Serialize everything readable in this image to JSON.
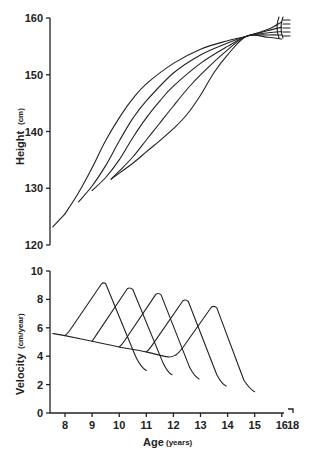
{
  "chart_data": [
    {
      "type": "line",
      "title": "",
      "ylabel": "Height",
      "ylabel_unit": "(cm)",
      "xlabel": "",
      "ylim": [
        120,
        160
      ],
      "xlim": [
        7.55,
        16.3
      ],
      "yticks": [
        120,
        130,
        140,
        150,
        160
      ],
      "grid": false,
      "legend": "none",
      "common_start": [
        [
          7.55,
          123.2
        ],
        [
          8.0,
          125.5
        ]
      ],
      "series": [
        {
          "name": "curve-1",
          "points": [
            [
              8.0,
              125.5
            ],
            [
              8.5,
              129.2
            ],
            [
              9.0,
              133.6
            ],
            [
              9.5,
              138.4
            ],
            [
              10.0,
              142.4
            ],
            [
              10.5,
              145.8
            ],
            [
              11.0,
              148.4
            ],
            [
              12.0,
              152.0
            ],
            [
              13.0,
              154.5
            ],
            [
              14.0,
              156.0
            ],
            [
              14.7,
              156.8
            ],
            [
              15.5,
              158.0
            ],
            [
              16.0,
              159.3
            ]
          ]
        },
        {
          "name": "curve-2",
          "points": [
            [
              8.5,
              127.6
            ],
            [
              9.0,
              130.4
            ],
            [
              9.5,
              134.0
            ],
            [
              10.0,
              138.3
            ],
            [
              10.5,
              142.3
            ],
            [
              11.0,
              145.4
            ],
            [
              12.0,
              150.3
            ],
            [
              13.0,
              153.5
            ],
            [
              14.0,
              155.6
            ],
            [
              14.7,
              156.8
            ],
            [
              15.5,
              157.8
            ],
            [
              16.0,
              158.4
            ]
          ]
        },
        {
          "name": "curve-3",
          "points": [
            [
              9.0,
              129.6
            ],
            [
              9.5,
              131.9
            ],
            [
              10.0,
              135.0
            ],
            [
              10.5,
              138.9
            ],
            [
              11.0,
              142.4
            ],
            [
              11.5,
              145.4
            ],
            [
              12.0,
              148.0
            ],
            [
              13.0,
              152.0
            ],
            [
              14.0,
              155.0
            ],
            [
              14.7,
              156.8
            ],
            [
              15.5,
              157.4
            ],
            [
              16.0,
              157.6
            ]
          ]
        },
        {
          "name": "curve-4",
          "points": [
            [
              9.7,
              131.6
            ],
            [
              10.0,
              133.0
            ],
            [
              10.5,
              135.5
            ],
            [
              11.0,
              138.5
            ],
            [
              11.5,
              141.5
            ],
            [
              12.0,
              144.5
            ],
            [
              12.5,
              147.4
            ],
            [
              13.0,
              150.0
            ],
            [
              14.0,
              154.4
            ],
            [
              14.7,
              156.8
            ],
            [
              15.5,
              157.0
            ],
            [
              16.0,
              157.0
            ]
          ]
        },
        {
          "name": "curve-5",
          "points": [
            [
              9.7,
              131.6
            ],
            [
              10.5,
              134.4
            ],
            [
              11.0,
              136.4
            ],
            [
              11.5,
              138.4
            ],
            [
              12.0,
              140.5
            ],
            [
              12.5,
              143.0
            ],
            [
              13.0,
              146.4
            ],
            [
              13.5,
              150.4
            ],
            [
              14.0,
              153.5
            ],
            [
              14.7,
              156.8
            ],
            [
              15.5,
              156.6
            ],
            [
              16.0,
              156.3
            ]
          ]
        }
      ]
    },
    {
      "type": "line",
      "title": "",
      "ylabel": "Velocity",
      "ylabel_unit": "(cm/year)",
      "xlabel": "Age",
      "xlabel_unit": "(years)",
      "ylim": [
        0,
        10
      ],
      "xlim": [
        7.55,
        18
      ],
      "yticks": [
        0,
        2,
        4,
        6,
        8,
        10
      ],
      "xticks": [
        "8",
        "9",
        "10",
        "11",
        "12",
        "13",
        "14",
        "15",
        "16",
        "18"
      ],
      "xtick_values": [
        8,
        9,
        10,
        11,
        12,
        13,
        14,
        15,
        16,
        18
      ],
      "grid": false,
      "legend": "none",
      "baseline": [
        [
          7.55,
          5.6
        ],
        [
          8.0,
          5.45
        ],
        [
          9.0,
          5.05
        ],
        [
          10.0,
          4.65
        ],
        [
          11.0,
          4.3
        ],
        [
          11.8,
          3.95
        ],
        [
          12.1,
          4.1
        ]
      ],
      "series": [
        {
          "name": "peak-1",
          "points": [
            [
              8.0,
              5.45
            ],
            [
              8.1,
              5.6
            ],
            [
              9.35,
              9.1
            ],
            [
              9.5,
              9.1
            ],
            [
              10.6,
              4.0
            ],
            [
              10.8,
              3.2
            ],
            [
              11.0,
              3.0
            ]
          ],
          "peak": {
            "age": 9.45,
            "velocity": 9.2
          }
        },
        {
          "name": "peak-2",
          "points": [
            [
              9.0,
              5.05
            ],
            [
              9.05,
              5.2
            ],
            [
              10.3,
              8.75
            ],
            [
              10.5,
              8.7
            ],
            [
              11.6,
              3.6
            ],
            [
              11.8,
              2.8
            ],
            [
              11.95,
              2.7
            ]
          ],
          "peak": {
            "age": 10.45,
            "velocity": 8.8
          }
        },
        {
          "name": "peak-3",
          "points": [
            [
              10.0,
              4.65
            ],
            [
              10.1,
              4.8
            ],
            [
              11.35,
              8.35
            ],
            [
              11.55,
              8.3
            ],
            [
              12.6,
              3.2
            ],
            [
              12.8,
              2.5
            ],
            [
              12.95,
              2.4
            ]
          ],
          "peak": {
            "age": 11.45,
            "velocity": 8.4
          }
        },
        {
          "name": "peak-4",
          "points": [
            [
              11.0,
              4.3
            ],
            [
              11.1,
              4.45
            ],
            [
              12.35,
              7.9
            ],
            [
              12.55,
              7.85
            ],
            [
              13.6,
              2.7
            ],
            [
              13.8,
              2.0
            ],
            [
              13.95,
              1.9
            ]
          ],
          "peak": {
            "age": 12.45,
            "velocity": 7.9
          }
        },
        {
          "name": "peak-5",
          "points": [
            [
              12.1,
              4.1
            ],
            [
              12.25,
              4.35
            ],
            [
              13.4,
              7.45
            ],
            [
              13.6,
              7.4
            ],
            [
              14.6,
              2.3
            ],
            [
              14.85,
              1.6
            ],
            [
              15.0,
              1.5
            ]
          ],
          "peak": {
            "age": 13.5,
            "velocity": 7.45
          }
        }
      ]
    }
  ]
}
